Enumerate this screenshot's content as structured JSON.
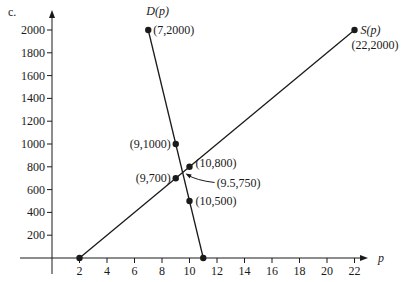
{
  "part_label": "c.",
  "chart_data": {
    "type": "line",
    "title": "",
    "xlabel": "p",
    "ylabel": "",
    "xlim": [
      0,
      23.5
    ],
    "ylim": [
      0,
      2150
    ],
    "x_ticks": [
      2,
      4,
      6,
      8,
      10,
      12,
      14,
      16,
      18,
      20,
      22
    ],
    "y_ticks": [
      200,
      400,
      600,
      800,
      1000,
      1200,
      1400,
      1600,
      1800,
      2000
    ],
    "grid": false,
    "series": [
      {
        "name": "D(p)",
        "points": [
          [
            7,
            2000
          ],
          [
            9,
            1000
          ],
          [
            9.5,
            750
          ],
          [
            10,
            500
          ],
          [
            11,
            0
          ]
        ]
      },
      {
        "name": "S(p)",
        "points": [
          [
            2,
            0
          ],
          [
            9,
            700
          ],
          [
            9.5,
            750
          ],
          [
            10,
            800
          ],
          [
            22,
            2000
          ]
        ]
      }
    ],
    "annotations": [
      {
        "text": "D(p)",
        "x": 7,
        "y": 2000,
        "kind": "function"
      },
      {
        "text": "(7,2000)",
        "x": 7,
        "y": 2000
      },
      {
        "text": "S(p)",
        "x": 22,
        "y": 2000,
        "kind": "function"
      },
      {
        "text": "(22,2000)",
        "x": 22,
        "y": 2000
      },
      {
        "text": "(9,1000)",
        "x": 9,
        "y": 1000
      },
      {
        "text": "(10,800)",
        "x": 10,
        "y": 800
      },
      {
        "text": "(9,700)",
        "x": 9,
        "y": 700
      },
      {
        "text": "(9.5,750)",
        "x": 9.5,
        "y": 750,
        "arrow": true
      },
      {
        "text": "(10,500)",
        "x": 10,
        "y": 500
      }
    ],
    "dots": [
      [
        7,
        2000
      ],
      [
        22,
        2000
      ],
      [
        9,
        1000
      ],
      [
        10,
        800
      ],
      [
        9,
        700
      ],
      [
        10,
        500
      ],
      [
        2,
        0
      ],
      [
        11,
        0
      ]
    ]
  }
}
